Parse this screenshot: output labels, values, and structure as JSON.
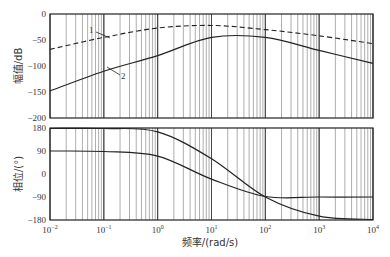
{
  "chart_data": [
    {
      "type": "line",
      "title": "",
      "xlabel": "频率/(rad/s)",
      "ylabel": "幅值/dB",
      "xscale": "log",
      "xlim": [
        0.01,
        10000
      ],
      "ylim": [
        -200,
        0
      ],
      "yticks": [
        0,
        -50,
        -100,
        -150,
        -200
      ],
      "grid": "vertical log grid",
      "annotations": [
        "1",
        "2"
      ],
      "series": [
        {
          "name": "1",
          "style": "dashed",
          "x": [
            0.01,
            0.1,
            1,
            10,
            100,
            1000,
            10000
          ],
          "y": [
            -68,
            -45,
            -27,
            -22,
            -30,
            -42,
            -57
          ]
        },
        {
          "name": "2",
          "style": "solid",
          "x": [
            0.01,
            0.1,
            1,
            10,
            100,
            1000,
            10000
          ],
          "y": [
            -148,
            -110,
            -80,
            -45,
            -45,
            -70,
            -95
          ]
        }
      ]
    },
    {
      "type": "line",
      "title": "",
      "xlabel": "频率/(rad/s)",
      "ylabel": "相位/(°)",
      "xscale": "log",
      "xlim": [
        0.01,
        10000
      ],
      "ylim": [
        -180,
        180
      ],
      "yticks": [
        180,
        90,
        0,
        -90,
        -180
      ],
      "xticks": [
        "10^-2",
        "10^-1",
        "10^0",
        "10^1",
        "10^2",
        "10^3",
        "10^4"
      ],
      "grid": "vertical log grid",
      "series": [
        {
          "name": "1",
          "style": "solid",
          "x": [
            0.01,
            0.1,
            1,
            10,
            100,
            1000,
            10000
          ],
          "y": [
            178,
            178,
            165,
            60,
            -90,
            -165,
            -178
          ]
        },
        {
          "name": "2",
          "style": "solid",
          "x": [
            0.01,
            0.1,
            1,
            10,
            100,
            1000,
            10000
          ],
          "y": [
            90,
            88,
            70,
            -20,
            -88,
            -90,
            -90
          ]
        }
      ]
    }
  ],
  "labels": {
    "mag_ylabel": "幅值/dB",
    "phase_ylabel": "相位/(°)",
    "xlabel": "频率/(rad/s)",
    "mag_yticks": [
      "0",
      "−50",
      "−100",
      "−150",
      "−200"
    ],
    "phase_yticks": [
      "180",
      "90",
      "0",
      "−90",
      "−180"
    ],
    "xticks_base": [
      "10",
      "10",
      "10",
      "10",
      "10",
      "10",
      "10"
    ],
    "xticks_exp": [
      "−2",
      "−1",
      "0",
      "1",
      "2",
      "3",
      "4"
    ],
    "curve1": "1",
    "curve2": "2"
  }
}
